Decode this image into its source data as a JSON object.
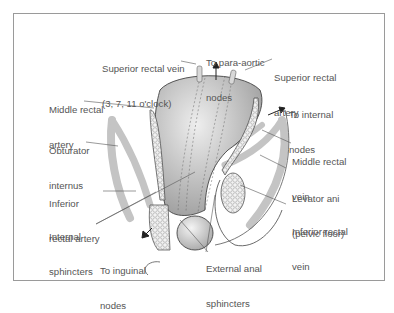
{
  "figure": {
    "labels": {
      "superior_rectal_vein": "Superior rectal vein",
      "superior_rectal_vein_sub": "(3, 7, 11 o'clock)",
      "para_aortic": "To para-aortic",
      "para_aortic_sub": "nodes",
      "superior_rectal_artery": "Superior rectal",
      "superior_rectal_artery_sub": "artery",
      "middle_rectal_artery": "Middle rectal",
      "middle_rectal_artery_sub": "artery",
      "internal_nodes": "To internal",
      "internal_nodes_sub": "nodes",
      "obturator_internus": "Obturator",
      "obturator_internus_sub": "internus",
      "middle_rectal_vein": "Middle rectal",
      "middle_rectal_vein_sub": "vein",
      "levator_ani": "Levator ani",
      "levator_ani_sub": "(pelvic floor)",
      "inferior_rectal_artery": "Inferior",
      "inferior_rectal_artery_sub": "rectal artery",
      "inferior_rectal_vein": "Inferior rectal",
      "inferior_rectal_vein_sub": "vein",
      "internal_sphincters": "Internal",
      "internal_sphincters_sub": "sphincters",
      "inguinal_nodes": "To inguinal",
      "inguinal_nodes_sub": "nodes",
      "external_anal_sphincters": "External anal",
      "external_anal_sphincters_sub": "sphincters"
    }
  }
}
